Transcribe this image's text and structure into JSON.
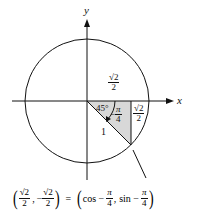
{
  "diagram": {
    "type": "unit-circle",
    "axes": {
      "x_label": "x",
      "y_label": "y"
    },
    "angle_label_degrees": "45°",
    "angle_label_radians": {
      "sign": "−",
      "num": "π",
      "den": "4"
    },
    "hypotenuse_label": "1",
    "horizontal_leg_label": {
      "num": "√2",
      "den": "2"
    },
    "vertical_leg_label": {
      "num": "√2",
      "den": "2"
    },
    "point_equation": {
      "left": {
        "x": {
          "num": "√2",
          "den": "2"
        },
        "y_sign": "−",
        "y": {
          "num": "√2",
          "den": "2"
        }
      },
      "equals": "=",
      "right": {
        "cos": "cos −",
        "sin": "sin −",
        "num": "π",
        "den": "4"
      }
    },
    "colors": {
      "stroke": "#111111",
      "shade": "#d8d8d8"
    }
  }
}
